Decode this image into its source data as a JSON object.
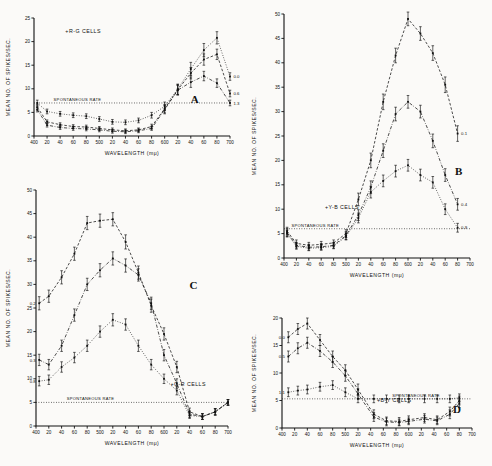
{
  "figure": {
    "background": "#fbfaf8",
    "ink": "#111111",
    "axis_title_y": "MEAN NO. OF SPIKES/SEC.",
    "axis_title_x": "WAVELENGTH (mμ)",
    "spontaneous_label": "SPONTANEOUS RATE"
  },
  "chart_data": [
    {
      "type": "line",
      "panel": "A",
      "title": "+R-G CELLS",
      "xlabel": "WAVELENGTH (mμ)",
      "ylabel": "MEAN NO. OF SPIKES/SEC.",
      "xlim": [
        400,
        700
      ],
      "ylim": [
        0,
        25
      ],
      "yticks": [
        0,
        5,
        10,
        15,
        20,
        25
      ],
      "xticks": [
        400,
        420,
        440,
        460,
        480,
        500,
        520,
        540,
        560,
        580,
        600,
        620,
        640,
        660,
        680,
        700
      ],
      "xtick_labels": [
        "400",
        "20",
        "40",
        "60",
        "80",
        "500",
        "20",
        "40",
        "60",
        "80",
        "600",
        "20",
        "40",
        "60",
        "80",
        "700"
      ],
      "spontaneous_rate": 7.0,
      "grid": false,
      "legend": "inline-right",
      "series": [
        {
          "name": "0.0",
          "style": "dotted",
          "x": [
            405,
            420,
            440,
            460,
            480,
            500,
            520,
            540,
            560,
            580,
            600,
            620,
            640,
            660,
            680,
            700
          ],
          "values": [
            7.0,
            5.2,
            4.7,
            4.4,
            4.2,
            3.6,
            3.0,
            2.9,
            3.3,
            4.4,
            6.3,
            9.9,
            14.2,
            18.2,
            20.8,
            12.6
          ],
          "err": [
            0.6,
            0.5,
            0.5,
            0.5,
            0.5,
            0.5,
            0.5,
            0.5,
            0.5,
            0.6,
            0.9,
            1.1,
            1.4,
            1.4,
            1.3,
            0.8
          ]
        },
        {
          "name": "0.6",
          "style": "dashed",
          "x": [
            405,
            420,
            440,
            460,
            480,
            500,
            520,
            540,
            560,
            580,
            600,
            620,
            640,
            660,
            680,
            700
          ],
          "values": [
            6.1,
            3.0,
            2.4,
            2.0,
            1.9,
            1.6,
            1.3,
            1.1,
            1.3,
            2.0,
            5.8,
            9.8,
            13.3,
            16.2,
            17.3,
            9.0
          ],
          "err": [
            0.6,
            0.4,
            0.4,
            0.4,
            0.4,
            0.4,
            0.4,
            0.4,
            0.4,
            0.5,
            0.9,
            1.1,
            1.2,
            1.2,
            1.1,
            0.7
          ]
        },
        {
          "name": "1.3",
          "style": "dashdot",
          "x": [
            405,
            420,
            440,
            460,
            480,
            500,
            520,
            540,
            560,
            580,
            600,
            620,
            640,
            660,
            680,
            700
          ],
          "values": [
            5.6,
            2.3,
            1.8,
            1.6,
            1.5,
            1.3,
            1.0,
            0.9,
            1.1,
            1.6,
            5.6,
            9.7,
            11.4,
            12.7,
            11.2,
            7.0
          ],
          "err": [
            0.5,
            0.4,
            0.4,
            0.4,
            0.4,
            0.4,
            0.4,
            0.4,
            0.4,
            0.4,
            0.9,
            1.0,
            1.1,
            1.0,
            0.9,
            0.6
          ]
        }
      ]
    },
    {
      "type": "line",
      "panel": "B",
      "title": "+Y-B CELLS",
      "xlabel": "WAVELENGTH (mμ)",
      "ylabel": "MEAN NO. OF SPIKES/SEC.",
      "xlim": [
        400,
        700
      ],
      "ylim": [
        0,
        50
      ],
      "yticks": [
        0,
        5,
        10,
        15,
        20,
        25,
        30,
        35,
        40,
        45,
        50
      ],
      "xticks": [
        400,
        420,
        440,
        460,
        480,
        500,
        520,
        540,
        560,
        580,
        600,
        620,
        640,
        660,
        680,
        700
      ],
      "xtick_labels": [
        "400",
        "20",
        "40",
        "60",
        "80",
        "500",
        "20",
        "40",
        "60",
        "80",
        "600",
        "20",
        "40",
        "60",
        "80",
        "700"
      ],
      "spontaneous_rate": 6.0,
      "grid": false,
      "legend": "inline-right",
      "series": [
        {
          "name": "0.1",
          "style": "dashed",
          "x": [
            405,
            420,
            440,
            460,
            480,
            500,
            520,
            540,
            560,
            580,
            600,
            620,
            640,
            660,
            680
          ],
          "values": [
            5.5,
            3.0,
            2.6,
            2.8,
            3.1,
            5.0,
            12.0,
            20.0,
            32.0,
            41.5,
            49.0,
            46.0,
            42.0,
            35.5,
            25.5
          ],
          "err": [
            0.8,
            0.7,
            0.6,
            0.6,
            0.6,
            0.8,
            1.3,
            1.5,
            1.6,
            1.5,
            1.4,
            1.4,
            1.5,
            1.6,
            1.6
          ]
        },
        {
          "name": "0.4",
          "style": "dashdot",
          "x": [
            405,
            420,
            440,
            460,
            480,
            500,
            520,
            540,
            560,
            580,
            600,
            620,
            640,
            660,
            680
          ],
          "values": [
            5.2,
            2.6,
            2.2,
            2.3,
            2.6,
            4.6,
            8.8,
            14.5,
            22.0,
            29.5,
            32.0,
            30.0,
            24.0,
            17.0,
            11.0
          ],
          "err": [
            0.8,
            0.6,
            0.6,
            0.6,
            0.6,
            0.8,
            1.1,
            1.3,
            1.4,
            1.4,
            1.3,
            1.3,
            1.4,
            1.3,
            1.2
          ]
        },
        {
          "name": "0.9",
          "style": "dotted",
          "x": [
            405,
            420,
            440,
            460,
            480,
            500,
            520,
            540,
            560,
            580,
            600,
            620,
            640,
            660,
            680
          ],
          "values": [
            5.0,
            2.4,
            2.0,
            2.1,
            2.4,
            4.4,
            8.2,
            13.5,
            15.8,
            17.8,
            19.0,
            17.0,
            15.5,
            10.0,
            6.2
          ],
          "err": [
            0.7,
            0.6,
            0.5,
            0.5,
            0.5,
            0.7,
            1.0,
            1.2,
            1.2,
            1.2,
            1.2,
            1.2,
            1.2,
            1.1,
            0.9
          ]
        }
      ]
    },
    {
      "type": "line",
      "panel": "C",
      "title": "+G-R CELLS",
      "xlabel": "WAVELENGTH (mμ)",
      "ylabel": "MEAN NO. OF SPIKES/SEC.",
      "xlim": [
        400,
        700
      ],
      "ylim": [
        0,
        50
      ],
      "yticks": [
        0,
        5,
        10,
        15,
        20,
        25,
        30,
        35,
        40,
        45,
        50
      ],
      "xticks": [
        400,
        420,
        440,
        460,
        480,
        500,
        520,
        540,
        560,
        580,
        600,
        620,
        640,
        660,
        680,
        700
      ],
      "xtick_labels": [
        "400",
        "20",
        "40",
        "60",
        "80",
        "500",
        "20",
        "40",
        "60",
        "80",
        "600",
        "20",
        "40",
        "60",
        "80",
        "700"
      ],
      "spontaneous_rate": 5.0,
      "grid": false,
      "legend": "inline-left",
      "series": [
        {
          "name": "0.2",
          "style": "dashed",
          "x": [
            405,
            420,
            440,
            460,
            480,
            500,
            520,
            540,
            560,
            580,
            600,
            620,
            640,
            660,
            680,
            700
          ],
          "values": [
            26.0,
            27.5,
            31.5,
            36.5,
            43.0,
            43.5,
            43.8,
            39.0,
            32.5,
            25.5,
            19.5,
            12.5,
            3.0,
            2.0,
            3.0,
            5.0
          ],
          "err": [
            1.4,
            1.3,
            1.4,
            1.4,
            1.4,
            1.4,
            1.4,
            1.5,
            1.4,
            1.4,
            1.3,
            1.2,
            0.8,
            0.6,
            0.7,
            0.6
          ]
        },
        {
          "name": "0.3",
          "style": "dashdot",
          "x": [
            405,
            420,
            440,
            460,
            480,
            500,
            520,
            540,
            560,
            580,
            600,
            620,
            640,
            660,
            680,
            700
          ],
          "values": [
            14.0,
            13.0,
            17.0,
            23.5,
            30.0,
            33.0,
            35.5,
            34.0,
            32.0,
            26.0,
            15.0,
            9.0,
            2.5,
            2.0,
            3.0,
            5.0
          ],
          "err": [
            1.2,
            1.1,
            1.2,
            1.3,
            1.3,
            1.4,
            1.4,
            1.4,
            1.3,
            1.3,
            1.2,
            1.0,
            0.7,
            0.6,
            0.7,
            0.6
          ]
        },
        {
          "name": "0.8",
          "style": "dotted",
          "x": [
            405,
            420,
            440,
            460,
            480,
            500,
            520,
            540,
            560,
            580,
            600,
            620,
            640,
            660,
            680,
            700
          ],
          "values": [
            9.5,
            9.8,
            12.5,
            14.5,
            17.0,
            20.0,
            22.5,
            21.5,
            17.0,
            13.0,
            10.0,
            7.5,
            2.2,
            2.0,
            3.0,
            5.0
          ],
          "err": [
            1.0,
            1.0,
            1.1,
            1.1,
            1.2,
            1.2,
            1.3,
            1.2,
            1.2,
            1.1,
            1.0,
            0.9,
            0.6,
            0.6,
            0.6,
            0.6
          ]
        }
      ]
    },
    {
      "type": "line",
      "panel": "D",
      "title": "+B-Y CELLS",
      "xlabel": "WAVELENGTH (mμ)",
      "ylabel": "MEAN NO. OF SPIKES/SEC.",
      "xlim": [
        400,
        700
      ],
      "ylim": [
        0,
        20
      ],
      "yticks": [
        0,
        5,
        10,
        15,
        20
      ],
      "xticks": [
        400,
        420,
        440,
        460,
        480,
        500,
        520,
        540,
        560,
        580,
        600,
        620,
        640,
        660,
        680,
        700
      ],
      "xtick_labels": [
        "400",
        "20",
        "40",
        "60",
        "80",
        "500",
        "20",
        "40",
        "60",
        "80",
        "600",
        "20",
        "40",
        "60",
        "80",
        "700"
      ],
      "spontaneous_rate": 5.3,
      "grid": false,
      "legend": "inline-left",
      "series": [
        {
          "name": "0.0",
          "style": "dashed",
          "x": [
            410,
            425,
            440,
            460,
            480,
            500,
            520,
            545,
            565,
            585,
            600,
            625,
            645,
            665,
            680
          ],
          "values": [
            16.5,
            18.0,
            19.0,
            16.0,
            13.0,
            10.5,
            7.0,
            2.5,
            1.3,
            1.2,
            1.5,
            1.9,
            1.5,
            3.0,
            5.0
          ],
          "err": [
            1.0,
            1.0,
            1.0,
            1.0,
            1.0,
            1.0,
            1.0,
            0.8,
            0.7,
            0.7,
            0.7,
            0.7,
            0.7,
            0.8,
            0.8
          ]
        },
        {
          "name": "0.5",
          "style": "dashdot",
          "x": [
            410,
            425,
            440,
            460,
            480,
            500,
            520,
            545,
            565,
            585,
            600,
            625,
            645,
            665,
            680
          ],
          "values": [
            13.0,
            14.5,
            15.5,
            14.0,
            12.0,
            9.5,
            6.2,
            2.0,
            1.1,
            1.0,
            1.2,
            1.6,
            1.3,
            2.5,
            4.5
          ],
          "err": [
            1.0,
            1.0,
            1.0,
            1.0,
            1.0,
            1.0,
            0.9,
            0.8,
            0.7,
            0.6,
            0.6,
            0.7,
            0.7,
            0.8,
            0.8
          ]
        },
        {
          "name": "1.1",
          "style": "dotted",
          "x": [
            410,
            425,
            440,
            460,
            480,
            500,
            520,
            545,
            565,
            585,
            600,
            625,
            645,
            665,
            680
          ],
          "values": [
            6.5,
            6.8,
            7.0,
            7.5,
            7.8,
            6.5,
            5.3,
            5.3,
            5.3,
            5.3,
            5.3,
            5.3,
            5.3,
            5.3,
            5.5
          ],
          "err": [
            0.8,
            0.8,
            0.8,
            0.8,
            0.8,
            0.8,
            0.7,
            0.7,
            0.7,
            0.7,
            0.7,
            0.7,
            0.7,
            0.7,
            0.7
          ]
        }
      ]
    }
  ],
  "panels": [
    {
      "letter": "A",
      "title": "+R-G CELLS"
    },
    {
      "letter": "B",
      "title": "+Y-B CELLS"
    },
    {
      "letter": "C",
      "title": "+G-R CELLS"
    },
    {
      "letter": "D",
      "title": "+B-Y CELLS"
    }
  ]
}
